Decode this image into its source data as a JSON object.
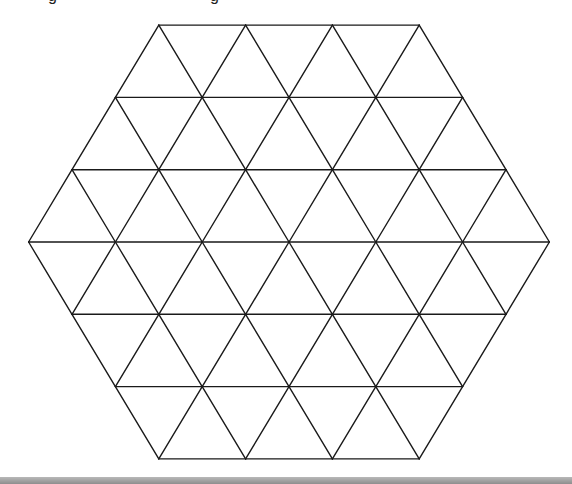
{
  "diagram": {
    "type": "triangular-grid-hexagon",
    "triangles_per_side": 3,
    "total_small_triangles": 54,
    "center": [
      289,
      242
    ],
    "unit_px": 86.8,
    "row_height_px": 72.3,
    "stroke_color": "#1a1a1a",
    "stroke_width": 1.4,
    "background_color": "#ffffff"
  },
  "top_text": {
    "left_fragment": "g",
    "right_fragment": "g"
  },
  "bottom_bar": {
    "color_top": "#b8b8b8",
    "color_bottom": "#8e8e8e"
  }
}
